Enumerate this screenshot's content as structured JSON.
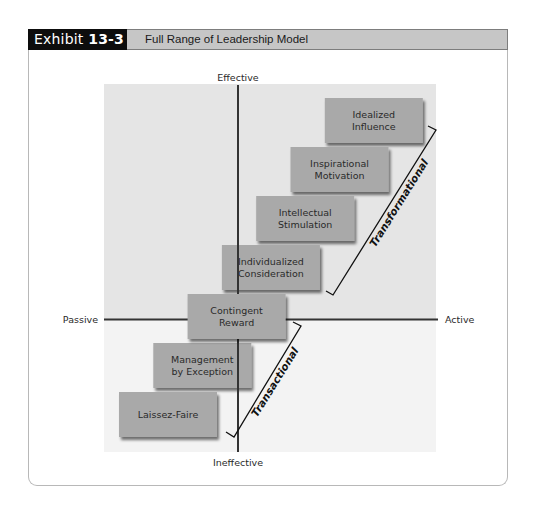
{
  "exhibit": {
    "prefix": "Exhibit",
    "number": "13-3",
    "title": "Full Range of Leadership Model"
  },
  "axes": {
    "top": "Effective",
    "bottom": "Ineffective",
    "left": "Passive",
    "right": "Active"
  },
  "styles": {
    "box_fill": "#a9a9a9",
    "upper_bg": "#e5e5e5",
    "lower_bg": "#f3f3f3",
    "axis_color": "#333333"
  },
  "boxes": [
    {
      "id": "idealized-influence",
      "lines": [
        "Idealized",
        "Influence"
      ],
      "level": 8
    },
    {
      "id": "inspirational-motivation",
      "lines": [
        "Inspirational",
        "Motivation"
      ],
      "level": 7
    },
    {
      "id": "intellectual-stimulation",
      "lines": [
        "Intellectual",
        "Stimulation"
      ],
      "level": 6
    },
    {
      "id": "individualized-consideration",
      "lines": [
        "Individualized",
        "Consideration"
      ],
      "level": 5
    },
    {
      "id": "contingent-reward",
      "lines": [
        "Contingent",
        "Reward"
      ],
      "level": 4
    },
    {
      "id": "management-by-exception",
      "lines": [
        "Management",
        "by Exception"
      ],
      "level": 3
    },
    {
      "id": "laissez-faire",
      "lines": [
        "Laissez-Faire"
      ],
      "level": 2
    }
  ],
  "groups": [
    {
      "id": "transformational",
      "label": "Transformational",
      "from_level": 5,
      "to_level": 8
    },
    {
      "id": "transactional",
      "label": "Transactional",
      "from_level": 2,
      "to_level": 4
    }
  ]
}
